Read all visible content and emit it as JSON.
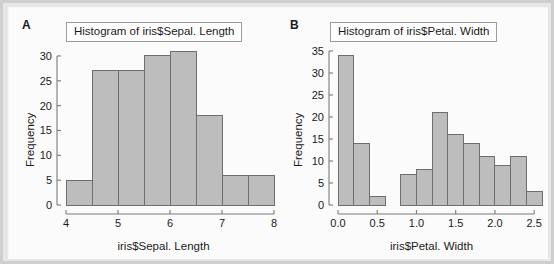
{
  "figure": {
    "background": "#fbfbfb",
    "frame_color": "#cfcfcf",
    "bar_fill": "#bdbdbd",
    "bar_stroke": "#6e6e6e",
    "axis_color": "#7a7a7a",
    "text_color": "#1a1a1a"
  },
  "panels": [
    {
      "letter": "A",
      "title": "Histogram of iris$Sepal. Length",
      "chart_data": {
        "type": "bar",
        "title": "Histogram of iris$Sepal. Length",
        "xlabel": "iris$Sepal. Length",
        "ylabel": "Frequency",
        "xlim": [
          4,
          8
        ],
        "ylim": [
          0,
          31
        ],
        "xticks": [
          "4",
          "5",
          "6",
          "7",
          "8"
        ],
        "xtick_values": [
          4,
          5,
          6,
          7,
          8
        ],
        "yticks": [
          "0",
          "5",
          "10",
          "15",
          "20",
          "25",
          "30"
        ],
        "ytick_values": [
          0,
          5,
          10,
          15,
          20,
          25,
          30
        ],
        "bin_width": 0.5,
        "bin_edges": [
          4.0,
          4.5,
          5.0,
          5.5,
          6.0,
          6.5,
          7.0,
          7.5,
          8.0
        ],
        "categories": [
          "4.0-4.5",
          "4.5-5.0",
          "5.0-5.5",
          "5.5-6.0",
          "6.0-6.5",
          "6.5-7.0",
          "7.0-7.5",
          "7.5-8.0"
        ],
        "values": [
          5,
          27,
          27,
          30,
          31,
          18,
          6,
          6
        ],
        "grid": false,
        "legend": null
      }
    },
    {
      "letter": "B",
      "title": "Histogram of iris$Petal. Width",
      "chart_data": {
        "type": "bar",
        "title": "Histogram of iris$Petal. Width",
        "xlabel": "iris$Petal. Width",
        "ylabel": "Frequency",
        "xlim": [
          0.0,
          2.6
        ],
        "ylim": [
          0,
          35
        ],
        "xticks": [
          "0.0",
          "0.5",
          "1.0",
          "1.5",
          "2.0",
          "2.5"
        ],
        "xtick_values": [
          0.0,
          0.5,
          1.0,
          1.5,
          2.0,
          2.5
        ],
        "yticks": [
          "0",
          "5",
          "10",
          "15",
          "20",
          "25",
          "30",
          "35"
        ],
        "ytick_values": [
          0,
          5,
          10,
          15,
          20,
          25,
          30,
          35
        ],
        "bin_width": 0.2,
        "bin_edges": [
          0.0,
          0.2,
          0.4,
          0.6,
          0.8,
          1.0,
          1.2,
          1.4,
          1.6,
          1.8,
          2.0,
          2.2,
          2.4,
          2.6
        ],
        "categories": [
          "0.0-0.2",
          "0.2-0.4",
          "0.4-0.6",
          "0.6-0.8",
          "0.8-1.0",
          "1.0-1.2",
          "1.2-1.4",
          "1.4-1.6",
          "1.6-1.8",
          "1.8-2.0",
          "2.0-2.2",
          "2.2-2.4",
          "2.4-2.6"
        ],
        "values": [
          34,
          14,
          2,
          0,
          7,
          8,
          21,
          16,
          14,
          11,
          9,
          11,
          3
        ],
        "grid": false,
        "legend": null
      }
    }
  ]
}
